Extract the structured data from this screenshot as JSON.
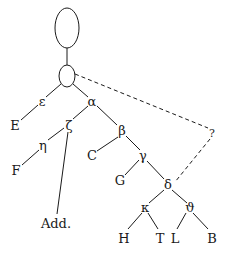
{
  "diagram": {
    "type": "stemma",
    "nodes": {
      "archetype": {
        "shape": "oval",
        "label": ""
      },
      "hyparchetype": {
        "shape": "oval",
        "label": ""
      },
      "epsilon": "ε",
      "alpha": "α",
      "zeta": "ζ",
      "eta": "η",
      "beta": "β",
      "gamma": "γ",
      "delta": "δ",
      "kappa": "κ",
      "theta": "ϑ",
      "E": "E",
      "F": "F",
      "C": "C",
      "G": "G",
      "H": "H",
      "T": "T",
      "L": "L",
      "B": "B",
      "Add": "Add.",
      "unknown": "?"
    },
    "edges_solid": [
      [
        "archetype",
        "hyparchetype"
      ],
      [
        "hyparchetype",
        "epsilon"
      ],
      [
        "hyparchetype",
        "alpha"
      ],
      [
        "epsilon",
        "E"
      ],
      [
        "alpha",
        "zeta"
      ],
      [
        "alpha",
        "beta"
      ],
      [
        "zeta",
        "eta"
      ],
      [
        "zeta",
        "Add"
      ],
      [
        "eta",
        "F"
      ],
      [
        "beta",
        "C"
      ],
      [
        "beta",
        "gamma"
      ],
      [
        "gamma",
        "G"
      ],
      [
        "gamma",
        "delta"
      ],
      [
        "delta",
        "kappa"
      ],
      [
        "delta",
        "theta"
      ],
      [
        "kappa",
        "H"
      ],
      [
        "kappa",
        "T"
      ],
      [
        "theta",
        "L"
      ],
      [
        "theta",
        "B"
      ]
    ],
    "edges_dashed": [
      [
        "hyparchetype",
        "unknown"
      ],
      [
        "unknown",
        "delta"
      ]
    ]
  }
}
